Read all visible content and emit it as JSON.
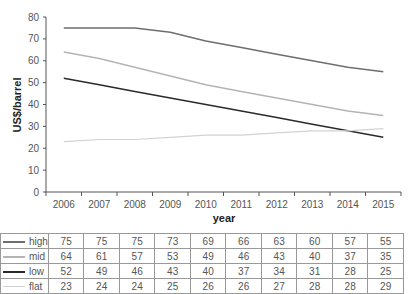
{
  "chart_data": {
    "type": "line",
    "title": "",
    "xlabel": "year",
    "ylabel": "US$/barrel",
    "ylim": [
      0,
      80
    ],
    "yticks": [
      0,
      10,
      20,
      30,
      40,
      50,
      60,
      70,
      80
    ],
    "grid": false,
    "legend_position": "table-below",
    "categories": [
      "2006",
      "2007",
      "2008",
      "2009",
      "2010",
      "2011",
      "2012",
      "2013",
      "2014",
      "2015"
    ],
    "series": [
      {
        "name": "high",
        "color": "#6e6e6e",
        "width": 1.5,
        "values": [
          75,
          75,
          75,
          73,
          69,
          66,
          63,
          60,
          57,
          55
        ]
      },
      {
        "name": "mid",
        "color": "#b4b4b4",
        "width": 1.5,
        "values": [
          64,
          61,
          57,
          53,
          49,
          46,
          43,
          40,
          37,
          35
        ]
      },
      {
        "name": "low",
        "color": "#2a2a2a",
        "width": 1.5,
        "values": [
          52,
          49,
          46,
          43,
          40,
          37,
          34,
          31,
          28,
          25
        ]
      },
      {
        "name": "flat",
        "color": "#d2d2d2",
        "width": 1.2,
        "values": [
          23,
          24,
          24,
          25,
          26,
          26,
          27,
          28,
          28,
          29
        ]
      }
    ]
  }
}
